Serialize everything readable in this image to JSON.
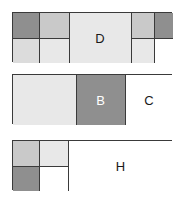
{
  "diagram": {
    "title": "",
    "type": "stacked-rectangle-partition",
    "canvas": {
      "width": 183,
      "height": 200,
      "background": "#ffffff"
    },
    "palette": {
      "dark_gray": "#8f8f8f",
      "mid_gray": "#c9c9c9",
      "light_gray": "#dcdcdc",
      "pale_gray": "#e8e8e8",
      "white": "#ffffff",
      "border": "#3a3a3a",
      "label_dark": "#1a1a1a",
      "label_light": "#ffffff"
    },
    "panels": [
      {
        "name": "panel-top",
        "x": 12,
        "y": 12,
        "width": 160,
        "height": 50,
        "cells": [
          {
            "name": "cell-a1",
            "label": "",
            "fill": "dark_gray",
            "x": 0,
            "y": 0,
            "width": 26,
            "height": 25
          },
          {
            "name": "cell-a2",
            "label": "",
            "fill": "mid_gray",
            "x": 26,
            "y": 0,
            "width": 30,
            "height": 25
          },
          {
            "name": "cell-a3",
            "label": "",
            "fill": "light_gray",
            "x": 0,
            "y": 25,
            "width": 26,
            "height": 25
          },
          {
            "name": "cell-a4",
            "label": "",
            "fill": "pale_gray",
            "x": 26,
            "y": 25,
            "width": 30,
            "height": 25
          },
          {
            "name": "cell-d",
            "label": "D",
            "fill": "pale_gray",
            "x": 56,
            "y": 0,
            "width": 62,
            "height": 50
          },
          {
            "name": "cell-a5",
            "label": "",
            "fill": "mid_gray",
            "x": 118,
            "y": 0,
            "width": 23,
            "height": 25
          },
          {
            "name": "cell-a6",
            "label": "",
            "fill": "pale_gray",
            "x": 118,
            "y": 25,
            "width": 23,
            "height": 25
          },
          {
            "name": "cell-a7",
            "label": "",
            "fill": "dark_gray",
            "x": 141,
            "y": 0,
            "width": 19,
            "height": 25
          },
          {
            "name": "cell-a8",
            "label": "",
            "fill": "white",
            "x": 141,
            "y": 25,
            "width": 19,
            "height": 25
          }
        ]
      },
      {
        "name": "panel-middle",
        "x": 12,
        "y": 74,
        "width": 160,
        "height": 50,
        "cells": [
          {
            "name": "cell-m1",
            "label": "",
            "fill": "pale_gray",
            "x": 0,
            "y": 0,
            "width": 63,
            "height": 50
          },
          {
            "name": "cell-b",
            "label": "B",
            "fill": "dark_gray",
            "x": 63,
            "y": 0,
            "width": 49,
            "height": 50
          },
          {
            "name": "cell-c",
            "label": "C",
            "fill": "white",
            "x": 112,
            "y": 0,
            "width": 48,
            "height": 50
          }
        ]
      },
      {
        "name": "panel-bottom",
        "x": 12,
        "y": 140,
        "width": 160,
        "height": 50,
        "cells": [
          {
            "name": "cell-z1",
            "label": "",
            "fill": "mid_gray",
            "x": 0,
            "y": 0,
            "width": 26,
            "height": 25
          },
          {
            "name": "cell-z2",
            "label": "",
            "fill": "pale_gray",
            "x": 26,
            "y": 0,
            "width": 29,
            "height": 25
          },
          {
            "name": "cell-z3",
            "label": "",
            "fill": "dark_gray",
            "x": 0,
            "y": 25,
            "width": 26,
            "height": 25
          },
          {
            "name": "cell-z4",
            "label": "",
            "fill": "white",
            "x": 26,
            "y": 25,
            "width": 29,
            "height": 25
          },
          {
            "name": "cell-h",
            "label": "H",
            "fill": "white",
            "x": 55,
            "y": 0,
            "width": 105,
            "height": 50
          }
        ]
      }
    ]
  }
}
